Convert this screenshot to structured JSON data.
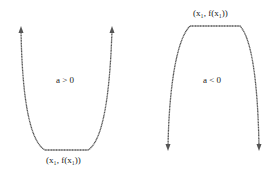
{
  "diagram": {
    "title": "",
    "left_panel": {
      "condition": "a > 0",
      "shape": "opens-up",
      "extremum_label": "(x₁, f(x₁))",
      "extremum_position": "bottom"
    },
    "right_panel": {
      "condition": "a < 0",
      "shape": "opens-down",
      "extremum_label": "(x₁, f(x₁))",
      "extremum_position": "top"
    },
    "colors": {
      "curve": "#555555",
      "text": "#222222",
      "background": "#ffffff"
    }
  }
}
